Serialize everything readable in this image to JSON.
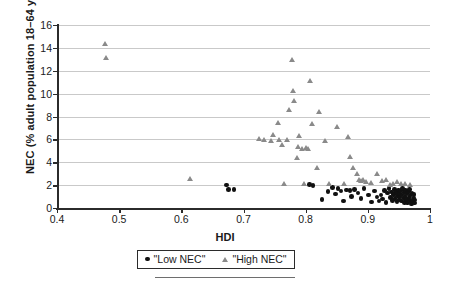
{
  "chart_data": {
    "type": "scatter",
    "title": "",
    "xlabel": "HDI",
    "ylabel": "NEC (% adult population 18–64 years old)",
    "xlim": [
      0.4,
      1.0
    ],
    "ylim": [
      0,
      16
    ],
    "xticks": [
      "0.4",
      "0.5",
      "0.6",
      "0.7",
      "0.8",
      "0.9",
      "1"
    ],
    "xtick_values": [
      0.4,
      0.5,
      0.6,
      0.7,
      0.8,
      0.9,
      1.0
    ],
    "yticks": [
      "0",
      "2",
      "4",
      "6",
      "8",
      "10",
      "12",
      "14",
      "16"
    ],
    "ytick_values": [
      0,
      2,
      4,
      6,
      8,
      10,
      12,
      14,
      16
    ],
    "grid": "horizontal",
    "legend_position": "bottom-center",
    "series": [
      {
        "name": "\"Low NEC\"",
        "marker": "circle",
        "color": "#111111",
        "points": [
          [
            0.673,
            2.0
          ],
          [
            0.676,
            1.62
          ],
          [
            0.685,
            1.6
          ],
          [
            0.806,
            2.05
          ],
          [
            0.812,
            1.95
          ],
          [
            0.826,
            0.72
          ],
          [
            0.836,
            1.42
          ],
          [
            0.843,
            1.78
          ],
          [
            0.848,
            1.22
          ],
          [
            0.852,
            1.7
          ],
          [
            0.857,
            1.48
          ],
          [
            0.861,
            0.62
          ],
          [
            0.866,
            1.58
          ],
          [
            0.871,
            1.52
          ],
          [
            0.874,
            1.0
          ],
          [
            0.879,
            1.62
          ],
          [
            0.884,
            1.3
          ],
          [
            0.889,
            0.82
          ],
          [
            0.894,
            1.7
          ],
          [
            0.901,
            1.15
          ],
          [
            0.906,
            0.52
          ],
          [
            0.911,
            1.48
          ],
          [
            0.915,
            0.95
          ],
          [
            0.918,
            0.62
          ],
          [
            0.921,
            1.12
          ],
          [
            0.924,
            0.78
          ],
          [
            0.927,
            1.55
          ],
          [
            0.929,
            0.48
          ],
          [
            0.932,
            1.3
          ],
          [
            0.934,
            1.72
          ],
          [
            0.936,
            0.92
          ],
          [
            0.938,
            1.4
          ],
          [
            0.94,
            0.65
          ],
          [
            0.941,
            1.18
          ],
          [
            0.943,
            1.62
          ],
          [
            0.944,
            0.85
          ],
          [
            0.946,
            1.35
          ],
          [
            0.947,
            0.55
          ],
          [
            0.948,
            1.05
          ],
          [
            0.949,
            1.58
          ],
          [
            0.95,
            0.72
          ],
          [
            0.951,
            1.28
          ],
          [
            0.952,
            0.95
          ],
          [
            0.953,
            1.48
          ],
          [
            0.954,
            0.6
          ],
          [
            0.955,
            1.15
          ],
          [
            0.956,
            1.68
          ],
          [
            0.957,
            0.88
          ],
          [
            0.958,
            1.38
          ],
          [
            0.959,
            0.5
          ],
          [
            0.96,
            1.02
          ],
          [
            0.961,
            1.55
          ],
          [
            0.962,
            0.75
          ],
          [
            0.963,
            1.25
          ],
          [
            0.964,
            0.42
          ],
          [
            0.965,
            1.45
          ],
          [
            0.966,
            0.92
          ],
          [
            0.967,
            1.62
          ],
          [
            0.968,
            0.68
          ],
          [
            0.969,
            1.12
          ],
          [
            0.97,
            0.35
          ],
          [
            0.971,
            1.32
          ],
          [
            0.972,
            0.58
          ],
          [
            0.973,
            0.88
          ],
          [
            0.974,
            1.2
          ],
          [
            0.975,
            0.45
          ],
          [
            0.976,
            0.7
          ]
        ]
      },
      {
        "name": "\"High NEC\"",
        "marker": "triangle",
        "color": "#8a8a8a",
        "points": [
          [
            0.478,
            14.3
          ],
          [
            0.48,
            13.1
          ],
          [
            0.615,
            2.55
          ],
          [
            0.726,
            6.05
          ],
          [
            0.733,
            5.95
          ],
          [
            0.745,
            5.85
          ],
          [
            0.748,
            6.35
          ],
          [
            0.756,
            7.4
          ],
          [
            0.758,
            5.9
          ],
          [
            0.762,
            5.45
          ],
          [
            0.766,
            2.05
          ],
          [
            0.771,
            5.95
          ],
          [
            0.774,
            8.55
          ],
          [
            0.778,
            12.95
          ],
          [
            0.78,
            10.25
          ],
          [
            0.782,
            9.35
          ],
          [
            0.786,
            4.35
          ],
          [
            0.788,
            5.3
          ],
          [
            0.79,
            6.3
          ],
          [
            0.794,
            5.1
          ],
          [
            0.797,
            2.05
          ],
          [
            0.801,
            5.25
          ],
          [
            0.804,
            5.15
          ],
          [
            0.808,
            11.05
          ],
          [
            0.811,
            7.35
          ],
          [
            0.818,
            3.45
          ],
          [
            0.822,
            8.4
          ],
          [
            0.831,
            5.8
          ],
          [
            0.838,
            2.05
          ],
          [
            0.851,
            7.05
          ],
          [
            0.862,
            2.08
          ],
          [
            0.868,
            6.15
          ],
          [
            0.871,
            4.45
          ],
          [
            0.876,
            3.45
          ],
          [
            0.883,
            2.95
          ],
          [
            0.886,
            2.45
          ],
          [
            0.889,
            2.35
          ],
          [
            0.893,
            2.4
          ],
          [
            0.897,
            2.28
          ],
          [
            0.906,
            2.15
          ],
          [
            0.915,
            2.92
          ],
          [
            0.923,
            2.35
          ],
          [
            0.929,
            2.42
          ],
          [
            0.936,
            1.98
          ],
          [
            0.941,
            2.08
          ],
          [
            0.948,
            2.3
          ],
          [
            0.954,
            2.05
          ],
          [
            0.961,
            2.12
          ],
          [
            0.968,
            2.02
          ]
        ]
      }
    ]
  },
  "legend": {
    "low": "\"Low NEC\"",
    "high": "\"High NEC\""
  }
}
